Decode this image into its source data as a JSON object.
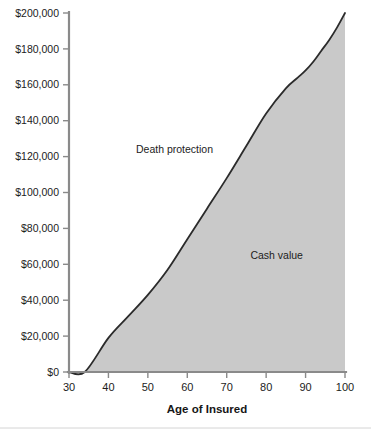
{
  "chart_data": {
    "type": "area",
    "title": "",
    "subtitle": "",
    "xlabel": "Age of Insured",
    "ylabel": "",
    "xlim": [
      30,
      100
    ],
    "ylim": [
      0,
      200000
    ],
    "grid": false,
    "legend_position": "inline-annotations",
    "x_ticks": [
      30,
      40,
      50,
      60,
      70,
      80,
      90,
      100
    ],
    "x_tick_labels": [
      "30",
      "40",
      "50",
      "60",
      "70",
      "80",
      "90",
      "100"
    ],
    "y_ticks": [
      0,
      20000,
      40000,
      60000,
      80000,
      100000,
      120000,
      140000,
      160000,
      180000,
      200000
    ],
    "y_tick_labels": [
      "$0",
      "$20,000",
      "$40,000",
      "$60,000",
      "$80,000",
      "$100,000",
      "$120,000",
      "$140,000",
      "$160,000",
      "$180,000",
      "$200,000"
    ],
    "series": [
      {
        "name": "Cash value",
        "fill_color": "#c9c9c9",
        "line_color": "#2b2b2b",
        "x": [
          30,
          34,
          40,
          45,
          50,
          55,
          60,
          65,
          70,
          75,
          80,
          85,
          88,
          90,
          92,
          94,
          96,
          98,
          100
        ],
        "values": [
          0,
          0,
          19000,
          31000,
          43000,
          57000,
          74000,
          91000,
          108000,
          126000,
          144000,
          158000,
          164000,
          168000,
          173000,
          179000,
          185000,
          192000,
          200000
        ]
      }
    ],
    "annotations": [
      {
        "text": "Death protection",
        "x": 47,
        "y": 122000,
        "region": "above-curve"
      },
      {
        "text": "Cash value",
        "x": 76,
        "y": 63000,
        "region": "inside-fill"
      }
    ]
  },
  "colors": {
    "fill": "#c9c9c9",
    "line": "#2b2b2b",
    "axis": "#8a8a8a",
    "text": "#1c1c1c",
    "background": "#ffffff"
  }
}
